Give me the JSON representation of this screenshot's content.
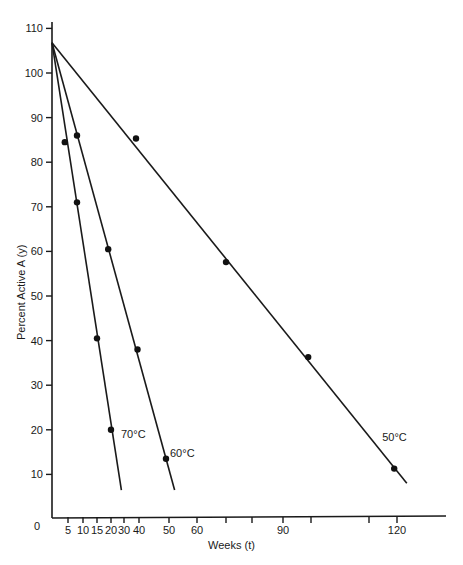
{
  "chart_data": {
    "type": "line",
    "title": "",
    "xlabel": "Weeks (t)",
    "ylabel": "Percent Active A (y)",
    "ylim": [
      0,
      110
    ],
    "xlim": [
      0,
      130
    ],
    "grid": false,
    "legend": "none (lines labeled inline)",
    "x_ticks": [
      5,
      10,
      15,
      20,
      30,
      40,
      50,
      60,
      70,
      80,
      90,
      100,
      110,
      120
    ],
    "x_tick_labels": [
      "5",
      "10",
      "15",
      "20",
      "30",
      "40",
      "50",
      "60",
      "",
      "",
      "90",
      "",
      "",
      "120"
    ],
    "x_axis_origin_label": "0",
    "y_ticks": [
      10,
      20,
      30,
      40,
      50,
      60,
      70,
      80,
      90,
      100,
      110
    ],
    "y_tick_labels": [
      "10",
      "20",
      "30",
      "40",
      "50",
      "60",
      "70",
      "80",
      "90",
      "100",
      "110"
    ],
    "series": [
      {
        "name": "70°C",
        "label": "70°C",
        "points": [
          [
            4,
            84.5
          ],
          [
            8,
            71
          ],
          [
            15,
            40.5
          ],
          [
            20,
            20
          ]
        ],
        "fit_line": [
          [
            0,
            106.8
          ],
          [
            28,
            6.5
          ]
        ]
      },
      {
        "name": "60°C",
        "label": "60°C",
        "points": [
          [
            8,
            86
          ],
          [
            19,
            60.5
          ],
          [
            39,
            38
          ],
          [
            49,
            13.5
          ]
        ],
        "fit_line": [
          [
            0,
            106.8
          ],
          [
            52,
            6.5
          ]
        ]
      },
      {
        "name": "50°C",
        "label": "50°C",
        "points": [
          [
            38,
            85.3
          ],
          [
            70,
            57.6
          ],
          [
            99,
            36.3
          ],
          [
            119,
            11.3
          ]
        ],
        "fit_line": [
          [
            0,
            106.8
          ],
          [
            122,
            8
          ]
        ]
      }
    ]
  }
}
